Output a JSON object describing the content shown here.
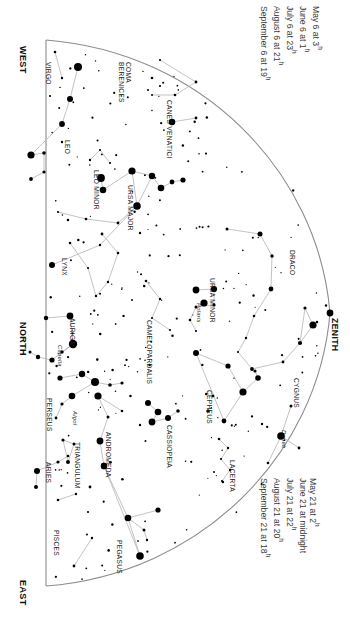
{
  "chart_data": {
    "type": "star-chart",
    "orientation": "rotated-90",
    "horizon_type": "straight meridian line with curved celestial boundary",
    "cardinal_directions": [
      {
        "name": "WEST",
        "x": 18,
        "y": 46
      },
      {
        "name": "NORTH",
        "x": 18,
        "y": 322
      },
      {
        "name": "EAST",
        "x": 18,
        "y": 580
      }
    ],
    "zenith": {
      "label": "ZENITH",
      "x": 330,
      "y": 318
    },
    "time_labels_top": [
      {
        "date": "May 6 at",
        "hour": "3",
        "sup": "h"
      },
      {
        "date": "June 6 at",
        "hour": "1",
        "sup": "h"
      },
      {
        "date": "July 6 at",
        "hour": "23",
        "sup": "h"
      },
      {
        "date": "August 6 at",
        "hour": "21",
        "sup": "h"
      },
      {
        "date": "September 6 at",
        "hour": "19",
        "sup": "h"
      }
    ],
    "time_labels_bottom": [
      {
        "date": "May 21 at",
        "hour": "2",
        "sup": "h"
      },
      {
        "date": "June 21 at",
        "hour": "midnight",
        "sup": ""
      },
      {
        "date": "July 21 at",
        "hour": "22",
        "sup": "h"
      },
      {
        "date": "August 21 at",
        "hour": "20",
        "sup": "h"
      },
      {
        "date": "September 21 at",
        "hour": "18",
        "sup": "h"
      }
    ],
    "constellations": [
      {
        "name": "VIRGO",
        "x": 44,
        "y": 62,
        "lines": 1
      },
      {
        "name": "COMA BERENICES",
        "x": 117,
        "y": 62,
        "lines": 2
      },
      {
        "name": "CANES VENATICI",
        "x": 165,
        "y": 100,
        "lines": 1
      },
      {
        "name": "LEO",
        "x": 63,
        "y": 140,
        "lines": 1
      },
      {
        "name": "LEO MINOR",
        "x": 92,
        "y": 170,
        "lines": 1
      },
      {
        "name": "URSA MAJOR",
        "x": 126,
        "y": 185,
        "lines": 1
      },
      {
        "name": "LYNX",
        "x": 60,
        "y": 258,
        "lines": 1
      },
      {
        "name": "DRACO",
        "x": 288,
        "y": 250,
        "lines": 1
      },
      {
        "name": "URSA MINOR",
        "x": 208,
        "y": 278,
        "lines": 1
      },
      {
        "name": "CAMELOPARDALIS",
        "x": 145,
        "y": 320,
        "lines": 1
      },
      {
        "name": "AURIGA",
        "x": 68,
        "y": 318,
        "lines": 1
      },
      {
        "name": "CEPHEUS",
        "x": 205,
        "y": 390,
        "lines": 1
      },
      {
        "name": "CYGNUS",
        "x": 292,
        "y": 378,
        "lines": 1
      },
      {
        "name": "PERSEUS",
        "x": 45,
        "y": 398,
        "lines": 1
      },
      {
        "name": "CASSIOPEIA",
        "x": 165,
        "y": 425,
        "lines": 1
      },
      {
        "name": "LACERTA",
        "x": 228,
        "y": 460,
        "lines": 1
      },
      {
        "name": "ANDROMEDA",
        "x": 104,
        "y": 432,
        "lines": 1
      },
      {
        "name": "TRIANGULUM",
        "x": 73,
        "y": 442,
        "lines": 1
      },
      {
        "name": "ARIES",
        "x": 44,
        "y": 462,
        "lines": 1
      },
      {
        "name": "PISCES",
        "x": 52,
        "y": 530,
        "lines": 1
      },
      {
        "name": "PEGASUS",
        "x": 115,
        "y": 540,
        "lines": 1
      }
    ],
    "named_stars": [
      {
        "name": "Capella",
        "x": 57,
        "y": 345
      },
      {
        "name": "Polaris",
        "x": 196,
        "y": 303
      },
      {
        "name": "Algol",
        "x": 72,
        "y": 411
      },
      {
        "name": "Deneb",
        "x": 281,
        "y": 430
      }
    ],
    "colors": {
      "background": "#ffffff",
      "star": "#000000",
      "constellation_line": "#b4b4b4",
      "horizon_line": "#8c8c8c",
      "label_text": "#1a1a1a",
      "time_text": "#3a3a3a"
    },
    "star_count_visible": 260,
    "magnitude_scale": {
      "brightest_radius_px": 4.2,
      "faintest_radius_px": 0.7
    }
  }
}
